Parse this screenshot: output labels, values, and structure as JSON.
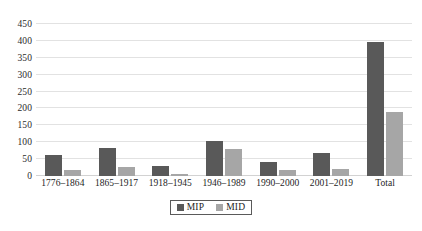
{
  "chart_data": {
    "type": "bar",
    "title": "",
    "subtitle": "",
    "xlabel": "",
    "ylabel": "",
    "ylim": [
      0,
      450
    ],
    "ytick_step": 50,
    "yticks": [
      0,
      50,
      100,
      150,
      200,
      250,
      300,
      350,
      400,
      450
    ],
    "ytick_labels": [
      "0",
      "50",
      "100",
      "150",
      "200",
      "250",
      "300",
      "350",
      "400",
      "450"
    ],
    "grid": true,
    "grid_axis": "y",
    "legend_position": "bottom-center",
    "categories": [
      "1776–1864",
      "1865–1917",
      "1918–1945",
      "1946–1989",
      "1990–2000",
      "2001–2019",
      "Total"
    ],
    "series": [
      {
        "name": "MIP",
        "color": "#595959",
        "values": [
          62,
          82,
          30,
          105,
          42,
          68,
          397
        ]
      },
      {
        "name": "MID",
        "color": "#a6a6a6",
        "values": [
          17,
          28,
          7,
          80,
          18,
          20,
          190
        ]
      }
    ]
  },
  "legend": {
    "items": [
      {
        "label": "MIP",
        "color": "#595959"
      },
      {
        "label": "MID",
        "color": "#a6a6a6"
      }
    ]
  },
  "colors": {
    "mip": "#595959",
    "mid": "#a6a6a6",
    "gridline": "#e2e2e2",
    "text": "#1d1d1d",
    "background": "#ffffff"
  }
}
